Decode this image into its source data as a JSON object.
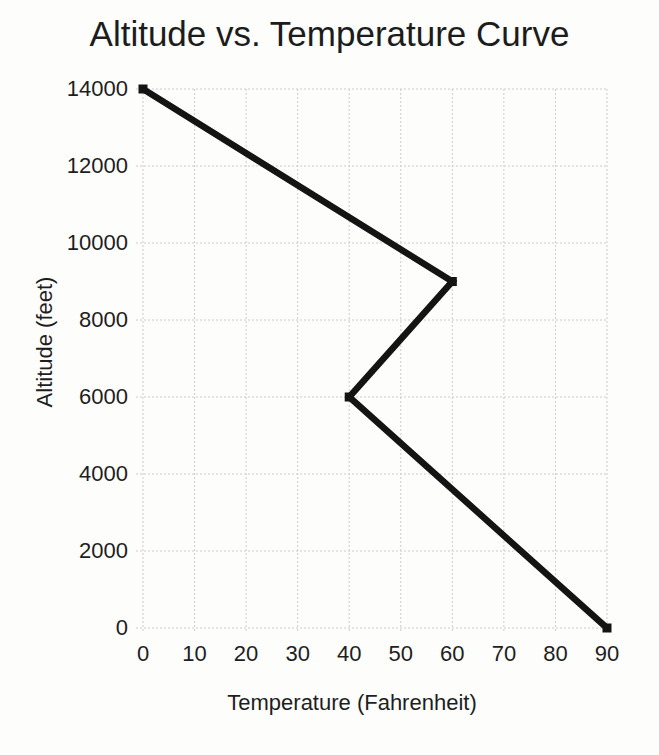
{
  "chart_data": {
    "type": "line",
    "title": "Altitude vs. Temperature Curve",
    "xlabel": "Temperature (Fahrenheit)",
    "ylabel": "Altitude (feet)",
    "points": [
      {
        "temperature": 0,
        "altitude": 14000
      },
      {
        "temperature": 60,
        "altitude": 9000
      },
      {
        "temperature": 40,
        "altitude": 6000
      },
      {
        "temperature": 90,
        "altitude": 0
      }
    ],
    "xlim": [
      0,
      90
    ],
    "ylim": [
      0,
      14000
    ],
    "xticks": [
      0,
      10,
      20,
      30,
      40,
      50,
      60,
      70,
      80,
      90
    ],
    "yticks": [
      0,
      2000,
      4000,
      6000,
      8000,
      10000,
      12000,
      14000
    ],
    "grid": true,
    "legend": "none",
    "line_color": "#141414",
    "marker": "square",
    "marker_color": "#141414",
    "grid_color": "#cccccc",
    "text_color": "#1e1e1e",
    "background_color": "#fdfdfc"
  }
}
